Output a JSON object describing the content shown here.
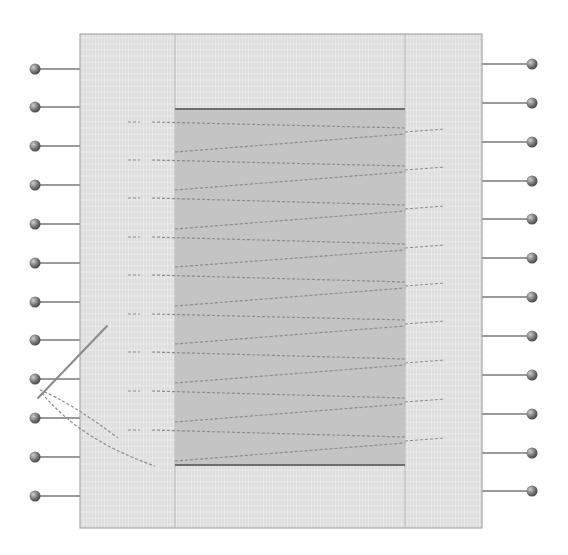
{
  "diagram": {
    "title": "",
    "colors": {
      "fabric": "#e6e6e6",
      "fabric_texture": "#d2d2d2",
      "fabric_border": "#9a9a9a",
      "panel": "#c4c4c4",
      "panel_edge": "#6e6e6e",
      "stitch": "#8c8c8c",
      "pin_line": "#9a9a9a",
      "pin_head": "#777777",
      "needle": "#8a8a8a"
    },
    "fabric": {
      "x": 80,
      "y": 34,
      "width": 402,
      "height": 494
    },
    "fabric_dividers_x": [
      175,
      405
    ],
    "panel": {
      "x": 175,
      "y": 109,
      "width": 230,
      "height": 356
    },
    "left_pins": {
      "head_x": 35,
      "line_end_x": 80,
      "y": [
        69,
        107,
        146,
        185,
        224,
        263,
        302,
        340,
        379,
        418,
        457,
        496
      ]
    },
    "right_pins": {
      "head_x": 532,
      "line_start_x": 482,
      "y": [
        64,
        103,
        142,
        181,
        219,
        258,
        297,
        336,
        375,
        414,
        453,
        491
      ]
    },
    "stitch_rows": [
      {
        "y_left": 122,
        "y_right": 128
      },
      {
        "y_left": 160,
        "y_right": 166
      },
      {
        "y_left": 198,
        "y_right": 205
      },
      {
        "y_left": 237,
        "y_right": 244
      },
      {
        "y_left": 275,
        "y_right": 282
      },
      {
        "y_left": 314,
        "y_right": 320
      },
      {
        "y_left": 352,
        "y_right": 359
      },
      {
        "y_left": 391,
        "y_right": 398
      },
      {
        "y_left": 430,
        "y_right": 437
      }
    ],
    "needle": {
      "x1": 107,
      "y1": 326,
      "x2": 38,
      "y2": 398
    }
  }
}
